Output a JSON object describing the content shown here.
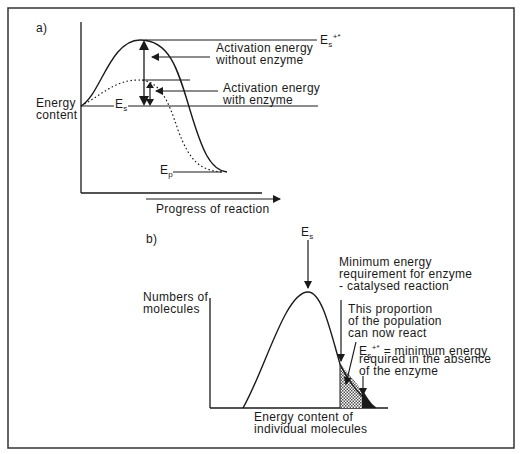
{
  "panel_a": {
    "label": "a)",
    "y_axis_label_line1": "Energy",
    "y_axis_label_line2": "content",
    "x_axis_label": "Progress of reaction",
    "es_label_main": "E",
    "es_label_sub": "s",
    "ep_label_main": "E",
    "ep_label_sub": "p",
    "es_plus_label_main": "E",
    "es_plus_label_sub": "s",
    "es_plus_label_sup": "+*",
    "annotation_without_line1": "Activation energy",
    "annotation_without_line2": "without enzyme",
    "annotation_with_line1": "Activation energy",
    "annotation_with_line2": "with enzyme"
  },
  "panel_b": {
    "label": "b)",
    "y_axis_label_line1": "Numbers of",
    "y_axis_label_line2": "molecules",
    "x_axis_label_line1": "Energy content of",
    "x_axis_label_line2": "individual molecules",
    "es_label_main": "E",
    "es_label_sub": "s",
    "min_energy_line1": "Minimum energy",
    "min_energy_line2": "requirement for enzyme",
    "min_energy_line3": "- catalysed reaction",
    "proportion_line1": "This proportion",
    "proportion_line2": "of the population",
    "proportion_line3": "can now react",
    "es_plus_main": "E",
    "es_plus_sub": "s",
    "es_plus_sup": "+*",
    "es_plus_def_line1": " = minimum energy",
    "es_plus_def_line2": "required in the absence",
    "es_plus_def_line3": "of the enzyme"
  }
}
